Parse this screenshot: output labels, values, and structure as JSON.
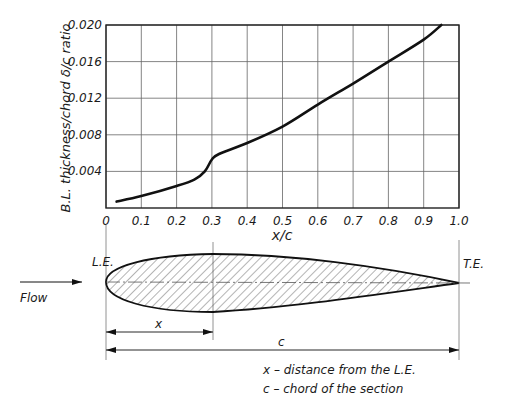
{
  "chart_data": {
    "type": "line",
    "title": "",
    "xlabel": "x/c",
    "ylabel": "B.L. thickness/chord  δ/c ratio",
    "xlim": [
      0,
      1.0
    ],
    "ylim": [
      0,
      0.02
    ],
    "grid": true,
    "x_ticks": [
      "0",
      "0.1",
      "0.2",
      "0.3",
      "0.4",
      "0.5",
      "0.6",
      "0.7",
      "0.8",
      "0.9",
      "1.0"
    ],
    "y_ticks": [
      "0.004",
      "0.008",
      "0.012",
      "0.016",
      "0.020"
    ],
    "series": [
      {
        "name": "δ/c",
        "x": [
          0.03,
          0.1,
          0.2,
          0.25,
          0.28,
          0.3,
          0.32,
          0.4,
          0.5,
          0.6,
          0.7,
          0.8,
          0.9,
          0.95
        ],
        "values": [
          0.0007,
          0.0013,
          0.0024,
          0.0031,
          0.004,
          0.0053,
          0.0059,
          0.0071,
          0.0089,
          0.0113,
          0.0136,
          0.016,
          0.0184,
          0.02
        ]
      }
    ]
  },
  "diagram": {
    "le_label": "L.E.",
    "te_label": "T.E.",
    "flow_label": "Flow",
    "x_dim_label": "x",
    "c_dim_label": "c",
    "legend": [
      "x – distance from the L.E.",
      "c – chord of the section"
    ]
  }
}
